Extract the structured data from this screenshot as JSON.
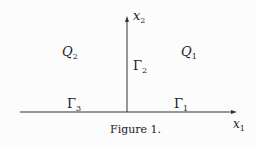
{
  "figure": {
    "caption": "Figure 1.",
    "axes": {
      "x": {
        "symbol": "x",
        "subscript": "1"
      },
      "y": {
        "symbol": "x",
        "subscript": "2"
      }
    },
    "regions": {
      "q2": {
        "symbol": "Q",
        "subscript": "2"
      },
      "q1": {
        "symbol": "Q",
        "subscript": "1"
      }
    },
    "boundaries": {
      "gamma2": {
        "symbol": "Γ",
        "subscript": "2"
      },
      "gamma3": {
        "symbol": "Γ",
        "subscript": "3"
      },
      "gamma1": {
        "symbol": "Γ",
        "subscript": "1"
      }
    },
    "colors": {
      "line": "#333333",
      "background": "#fcfcfc"
    }
  }
}
